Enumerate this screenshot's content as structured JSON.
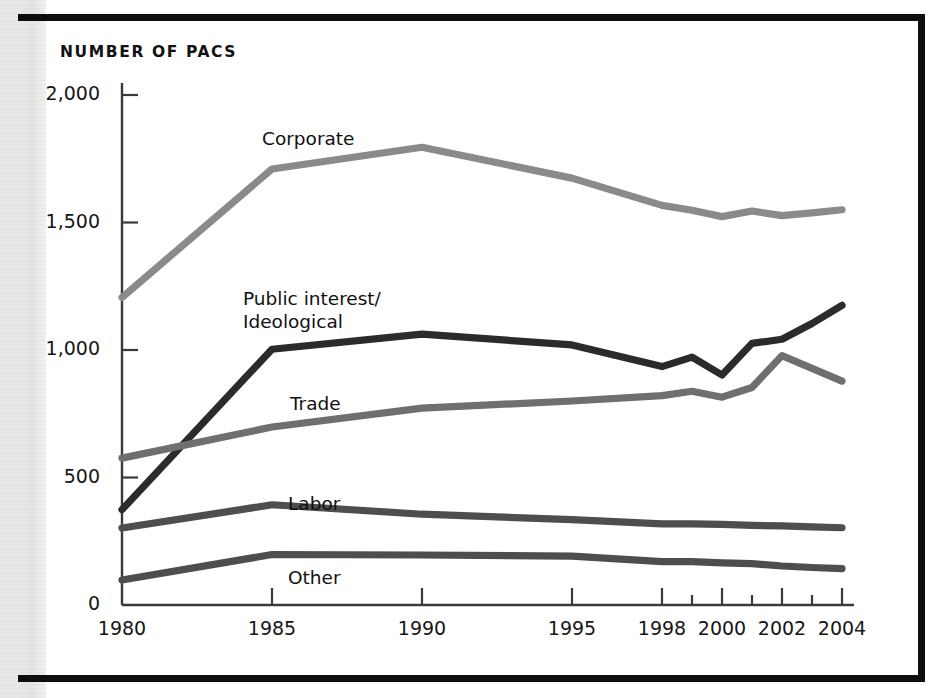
{
  "figure": {
    "title": "NUMBER OF PACS",
    "frame_color": "#0d0d0d",
    "background": "#ffffff"
  },
  "axes": {
    "y_ticks": [
      "2,000",
      "1,500",
      "1,000",
      "500",
      "0"
    ],
    "x_ticks_labeled": [
      "1980",
      "1985",
      "1990",
      "1995",
      "1998",
      "2000",
      "2002",
      "2004"
    ],
    "x_ticks_minor": [
      "1999",
      "2001",
      "2003"
    ]
  },
  "series_labels": {
    "corporate": "Corporate",
    "public_interest_line1": "Public interest/",
    "public_interest_line2": "Ideological",
    "trade": "Trade",
    "labor": "Labor",
    "other": "Other"
  },
  "chart_data": {
    "type": "line",
    "title": "NUMBER OF PACS",
    "xlabel": "",
    "ylabel": "NUMBER OF PACS",
    "ylim": [
      0,
      2000
    ],
    "yticks": [
      0,
      500,
      1000,
      1500,
      2000
    ],
    "xlim": [
      1980,
      2004
    ],
    "xticks": [
      1980,
      1985,
      1990,
      1995,
      1998,
      1999,
      2000,
      2001,
      2002,
      2003,
      2004
    ],
    "xtick_labels": [
      "1980",
      "1985",
      "1990",
      "1995",
      "1998",
      "",
      "2000",
      "",
      "2002",
      "",
      "2004"
    ],
    "grid": false,
    "legend": "inline-labels",
    "x": [
      1980,
      1985,
      1990,
      1995,
      1998,
      1999,
      2000,
      2001,
      2002,
      2003,
      2004
    ],
    "series": [
      {
        "name": "Corporate",
        "color": "#8a8a8a",
        "values": [
          1206,
          1710,
          1795,
          1674,
          1567,
          1548,
          1523,
          1545,
          1527,
          1538,
          1550
        ]
      },
      {
        "name": "Public interest/Ideological",
        "color": "#2b2b2b",
        "values": [
          374,
          1003,
          1062,
          1020,
          935,
          972,
          902,
          1026,
          1042,
          1104,
          1175
        ]
      },
      {
        "name": "Trade",
        "color": "#6f6f6f",
        "values": [
          576,
          698,
          772,
          800,
          821,
          838,
          815,
          853,
          978,
          928,
          878
        ]
      },
      {
        "name": "Labor",
        "color": "#4e4e4e",
        "values": [
          302,
          393,
          356,
          335,
          318,
          318,
          316,
          312,
          310,
          306,
          303
        ]
      },
      {
        "name": "Other",
        "color": "#4e4e4e",
        "values": [
          98,
          198,
          196,
          192,
          170,
          170,
          165,
          162,
          153,
          147,
          143
        ]
      }
    ]
  },
  "colors": {
    "corporate": "#8a8a8a",
    "public_interest": "#2b2b2b",
    "trade": "#6f6f6f",
    "labor": "#4e4e4e",
    "other": "#4e4e4e",
    "axis": "#3a3a3a",
    "text": "#161616"
  }
}
